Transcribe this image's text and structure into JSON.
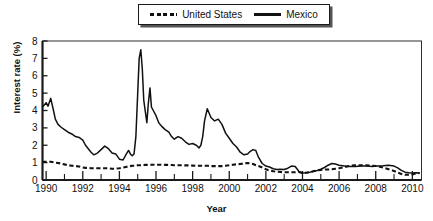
{
  "figure": {
    "ylabel": "Interest rate (%)",
    "xlabel": "Year"
  },
  "legend": {
    "position": "top-center",
    "entries": [
      {
        "label": "United States",
        "style": "dashed",
        "icon": "dashed-line-swatch"
      },
      {
        "label": "Mexico",
        "style": "solid",
        "icon": "solid-line-swatch"
      }
    ]
  },
  "axes": {
    "y_ticks": [
      "8",
      "7",
      "6",
      "5",
      "4",
      "3",
      "2",
      "1",
      "0"
    ],
    "x_ticks": [
      "1990",
      "1992",
      "1994",
      "1996",
      "1998",
      "2000",
      "2002",
      "2004",
      "2006",
      "2008",
      "2010"
    ],
    "x_minor_ticks": [
      "1991",
      "1993",
      "1995",
      "1997",
      "1999",
      "2001",
      "2003",
      "2005",
      "2007",
      "2009"
    ]
  },
  "colors": {
    "line": "#111111",
    "frame": "#1a1a1a",
    "background": "#ffffff"
  },
  "chart_data": {
    "type": "line",
    "title": "",
    "xlabel": "Year",
    "ylabel": "Interest rate (%)",
    "xlim": [
      1989.8,
      2010.5
    ],
    "ylim": [
      0,
      8
    ],
    "grid": false,
    "legend_position": "top-center",
    "x": [
      1989.8,
      1990.0,
      1990.1,
      1990.25,
      1990.4,
      1990.5,
      1990.65,
      1990.8,
      1991.0,
      1991.2,
      1991.4,
      1991.6,
      1991.8,
      1992.0,
      1992.15,
      1992.3,
      1992.45,
      1992.6,
      1992.8,
      1993.0,
      1993.2,
      1993.4,
      1993.6,
      1993.8,
      1994.0,
      1994.2,
      1994.35,
      1994.5,
      1994.6,
      1994.7,
      1994.8,
      1994.9,
      1995.0,
      1995.08,
      1995.17,
      1995.25,
      1995.33,
      1995.42,
      1995.5,
      1995.58,
      1995.67,
      1995.75,
      1995.85,
      1996.0,
      1996.15,
      1996.3,
      1996.5,
      1996.7,
      1996.85,
      1997.0,
      1997.2,
      1997.4,
      1997.6,
      1997.8,
      1998.0,
      1998.2,
      1998.35,
      1998.45,
      1998.55,
      1998.65,
      1998.8,
      1999.0,
      1999.2,
      1999.4,
      1999.6,
      1999.8,
      2000.0,
      2000.2,
      2000.4,
      2000.6,
      2000.8,
      2001.0,
      2001.15,
      2001.3,
      2001.45,
      2001.6,
      2001.8,
      2002.0,
      2002.2,
      2002.4,
      2002.6,
      2002.8,
      2003.0,
      2003.2,
      2003.4,
      2003.6,
      2003.8,
      2004.0,
      2004.2,
      2004.4,
      2004.6,
      2004.8,
      2005.0,
      2005.2,
      2005.4,
      2005.6,
      2005.8,
      2006.0,
      2006.3,
      2006.6,
      2006.9,
      2007.2,
      2007.5,
      2007.8,
      2008.1,
      2008.4,
      2008.7,
      2009.0,
      2009.2,
      2009.4,
      2009.6,
      2009.8,
      2010.0,
      2010.2,
      2010.4
    ],
    "series": [
      {
        "name": "Mexico",
        "style": "solid",
        "values": [
          4.2,
          4.45,
          4.25,
          4.7,
          4.0,
          3.5,
          3.2,
          3.05,
          2.9,
          2.75,
          2.65,
          2.5,
          2.45,
          2.3,
          2.0,
          1.8,
          1.6,
          1.45,
          1.55,
          1.75,
          1.95,
          1.8,
          1.55,
          1.5,
          1.2,
          1.15,
          1.45,
          1.7,
          1.5,
          1.4,
          1.5,
          2.5,
          5.0,
          7.0,
          7.5,
          6.4,
          4.6,
          3.9,
          3.3,
          4.4,
          5.3,
          4.2,
          4.0,
          3.7,
          3.3,
          3.1,
          2.9,
          2.75,
          2.5,
          2.35,
          2.5,
          2.4,
          2.2,
          2.05,
          2.1,
          2.0,
          1.85,
          2.0,
          2.5,
          3.4,
          4.1,
          3.6,
          3.4,
          3.5,
          3.2,
          2.7,
          2.4,
          2.1,
          1.9,
          1.6,
          1.45,
          1.5,
          1.65,
          1.75,
          1.7,
          1.3,
          0.95,
          0.8,
          0.75,
          0.65,
          0.6,
          0.62,
          0.6,
          0.68,
          0.8,
          0.78,
          0.5,
          0.4,
          0.42,
          0.45,
          0.5,
          0.55,
          0.62,
          0.72,
          0.85,
          0.95,
          0.92,
          0.85,
          0.8,
          0.78,
          0.78,
          0.8,
          0.8,
          0.78,
          0.8,
          0.82,
          0.85,
          0.8,
          0.7,
          0.55,
          0.45,
          0.42,
          0.4,
          0.42,
          0.4
        ]
      },
      {
        "name": "United States",
        "style": "dashed",
        "values": [
          1.05,
          1.05,
          1.05,
          1.05,
          1.02,
          1.0,
          0.98,
          0.95,
          0.9,
          0.85,
          0.82,
          0.8,
          0.78,
          0.72,
          0.7,
          0.7,
          0.68,
          0.68,
          0.68,
          0.68,
          0.68,
          0.67,
          0.65,
          0.65,
          0.68,
          0.72,
          0.75,
          0.78,
          0.8,
          0.82,
          0.82,
          0.83,
          0.85,
          0.85,
          0.85,
          0.86,
          0.86,
          0.87,
          0.87,
          0.87,
          0.88,
          0.88,
          0.88,
          0.88,
          0.88,
          0.88,
          0.87,
          0.87,
          0.86,
          0.85,
          0.85,
          0.85,
          0.84,
          0.84,
          0.83,
          0.82,
          0.82,
          0.82,
          0.82,
          0.82,
          0.82,
          0.8,
          0.8,
          0.8,
          0.8,
          0.82,
          0.85,
          0.88,
          0.9,
          0.92,
          0.95,
          0.98,
          0.95,
          0.92,
          0.85,
          0.8,
          0.72,
          0.62,
          0.55,
          0.5,
          0.48,
          0.46,
          0.45,
          0.45,
          0.45,
          0.45,
          0.46,
          0.4,
          0.42,
          0.45,
          0.5,
          0.55,
          0.58,
          0.6,
          0.6,
          0.62,
          0.65,
          0.68,
          0.75,
          0.82,
          0.85,
          0.85,
          0.85,
          0.82,
          0.8,
          0.72,
          0.62,
          0.52,
          0.42,
          0.35,
          0.3,
          0.3,
          0.32,
          0.38,
          0.4
        ]
      }
    ]
  }
}
